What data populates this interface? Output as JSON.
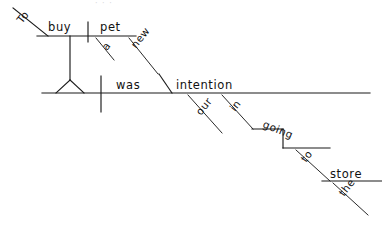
{
  "page": {
    "sentence": "To buy a new pet was our intention in going to the store.",
    "width": 382,
    "height": 230,
    "ink_color": "#1a1a1a",
    "background_color": "#ffffff"
  },
  "faint_header": {
    "text": "· · ·"
  },
  "words": {
    "to_infinitive": "To",
    "buy": "buy",
    "pet": "pet",
    "a": "a",
    "new": "new",
    "was": "was",
    "intention": "intention",
    "our": "our",
    "in": "in",
    "going": "going",
    "to_prep": "to",
    "store": "store",
    "the": "the"
  },
  "diagram": {
    "type": "reed-kellogg",
    "nodes": [
      {
        "id": "to-infinitive",
        "label": "To",
        "role": "infinitive-marker",
        "orientation": "diagonal-up-left",
        "x": 32,
        "y": 19
      },
      {
        "id": "buy",
        "label": "buy",
        "role": "infinitive-verb",
        "orientation": "horizontal",
        "x": 48,
        "y": 28
      },
      {
        "id": "pet",
        "label": "pet",
        "role": "direct-object-of-infinitive",
        "orientation": "horizontal",
        "x": 97,
        "y": 28
      },
      {
        "id": "a",
        "label": "a",
        "role": "article-modifier",
        "orientation": "diagonal",
        "x": 110,
        "y": 47
      },
      {
        "id": "new",
        "label": "new",
        "role": "adjective-modifier",
        "orientation": "diagonal",
        "x": 141,
        "y": 45
      },
      {
        "id": "was",
        "label": "was",
        "role": "linking-verb",
        "orientation": "horizontal",
        "x": 117,
        "y": 85
      },
      {
        "id": "intention",
        "label": "intention",
        "role": "predicate-nominative",
        "orientation": "horizontal",
        "x": 175,
        "y": 85
      },
      {
        "id": "our",
        "label": "our",
        "role": "possessive-modifier",
        "orientation": "diagonal",
        "x": 205,
        "y": 112
      },
      {
        "id": "in",
        "label": "in",
        "role": "preposition",
        "orientation": "diagonal",
        "x": 237,
        "y": 108
      },
      {
        "id": "going",
        "label": "going",
        "role": "gerund-object-of-preposition",
        "orientation": "stepped",
        "x": 268,
        "y": 127
      },
      {
        "id": "to-prep",
        "label": "to",
        "role": "preposition",
        "orientation": "diagonal",
        "x": 309,
        "y": 159
      },
      {
        "id": "store",
        "label": "store",
        "role": "object-of-preposition",
        "orientation": "horizontal",
        "x": 330,
        "y": 176
      },
      {
        "id": "the",
        "label": "the",
        "role": "article-modifier",
        "orientation": "diagonal",
        "x": 348,
        "y": 192
      }
    ],
    "structure": {
      "subject": "To buy a new pet",
      "verb": "was",
      "predicate_nominative": "intention",
      "modifiers": [
        "a",
        "new",
        "our"
      ],
      "prepositional_phrases": [
        "in going to the store"
      ]
    }
  }
}
